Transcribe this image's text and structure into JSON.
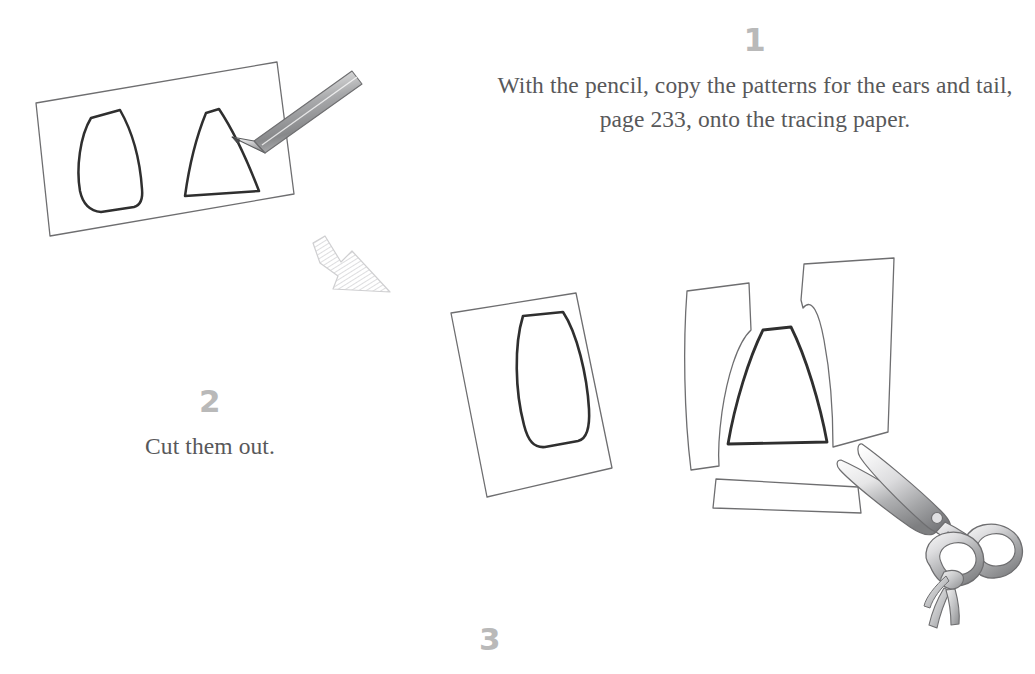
{
  "document": {
    "type": "craft-instruction-illustration",
    "background_color": "#ffffff",
    "text_color": "#58585a",
    "step_number_color": "#b9b9b9",
    "ink_color": "#3a3a3a",
    "light_ink_color": "#6e6e70"
  },
  "steps": [
    {
      "number": "1",
      "text": "With the pencil, copy the patterns for the ears and tail, page 233, onto the tracing paper."
    },
    {
      "number": "2",
      "text": "Cut them out."
    },
    {
      "number": "3",
      "text": ""
    }
  ],
  "illustrations": [
    {
      "name": "tracing-paper-with-pencil",
      "description": "Tilted sheet of tracing paper with an ear pattern and a tail pattern drawn on it, a pencil resting on the tail pattern",
      "parts": [
        "tracing-paper-sheet",
        "ear-pattern-outline",
        "tail-pattern-outline",
        "pencil"
      ]
    },
    {
      "name": "hatched-arrow-marker",
      "description": "Small diagonally hatched arrow pointer shape"
    },
    {
      "name": "cut-ear-pattern",
      "description": "Tilted paper rectangle containing the cut ear pattern outline",
      "parts": [
        "paper-sheet",
        "ear-pattern-outline"
      ]
    },
    {
      "name": "cut-tail-pattern",
      "description": "Cut out tail pattern triangle surrounded by leftover paper scraps",
      "parts": [
        "left-scrap-strip",
        "right-scrap-piece",
        "bottom-scrap-strip",
        "tail-pattern-outline"
      ]
    },
    {
      "name": "scissors",
      "description": "Open pair of scissors with a tasselled cord tied to the lower handle",
      "parts": [
        "upper-blade",
        "lower-blade",
        "pivot-screw",
        "upper-handle-ring",
        "lower-handle-ring",
        "tassel-cord"
      ]
    }
  ],
  "palette": {
    "metal_light": "#f2f2f2",
    "metal_mid": "#c9c9c9",
    "metal_dark": "#8f9092",
    "outline": "#6e6e70",
    "pattern_outline": "#2f2f2f"
  }
}
